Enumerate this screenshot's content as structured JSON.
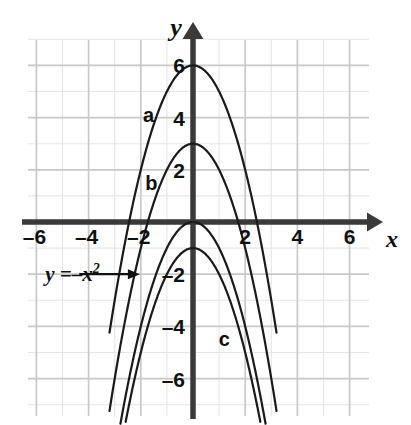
{
  "chart_data": {
    "type": "line",
    "title": "",
    "xlabel": "x",
    "ylabel": "y",
    "xlim": [
      -6.8,
      6.8
    ],
    "ylim": [
      -7.2,
      7.3
    ],
    "grid": true,
    "grid_spacing": 1,
    "x_ticks": [
      -6,
      -4,
      -2,
      2,
      4,
      6
    ],
    "x_tick_labels": [
      "–6",
      "–4",
      "–2",
      "2",
      "4",
      "6"
    ],
    "y_ticks": [
      6,
      4,
      2,
      -2,
      -4,
      -6
    ],
    "y_tick_labels": [
      "6",
      "4",
      "2",
      "–2",
      "–4",
      "–6"
    ],
    "series": [
      {
        "name": "a",
        "label": "a",
        "equation": "y = 6 - x^2",
        "vertex": [
          0,
          6
        ],
        "leading_coefficient": -1,
        "constant": 6,
        "roots": [
          -2.449,
          2.449
        ],
        "label_position": [
          -1.7,
          4.1
        ]
      },
      {
        "name": "b",
        "label": "b",
        "equation": "y = 3 - x^2",
        "vertex": [
          0,
          3
        ],
        "leading_coefficient": -1,
        "constant": 3,
        "roots": [
          -1.732,
          1.732
        ],
        "label_position": [
          -1.6,
          1.5
        ]
      },
      {
        "name": "base",
        "label": "y = -x²",
        "equation": "y = -x^2",
        "vertex": [
          0,
          0
        ],
        "leading_coefficient": -1,
        "constant": 0,
        "roots": [
          0,
          0
        ],
        "label_position": [
          -5.6,
          -2.0
        ]
      },
      {
        "name": "c",
        "label": "c",
        "equation": "y = -1 - x^2",
        "vertex": [
          0,
          -1
        ],
        "leading_coefficient": -1,
        "constant": -1,
        "roots": [],
        "label_position": [
          1.2,
          -4.5
        ]
      }
    ],
    "annotations": [
      {
        "name": "base-curve-callout",
        "text": "y =–x²",
        "arrow": "points right toward the y = -x² curve",
        "from": [
          -5.2,
          -2.0
        ],
        "to": [
          -2.15,
          -2.0
        ]
      }
    ]
  },
  "axes": {
    "y_axis_name": "y",
    "x_axis_name": "x"
  },
  "colors": {
    "axis": "#3a3a3a",
    "grid_major": "#c9c9c9",
    "grid_minor": "#e6e6e6",
    "curve": "#1a1a1a",
    "text": "#111111",
    "background": "#ffffff"
  }
}
